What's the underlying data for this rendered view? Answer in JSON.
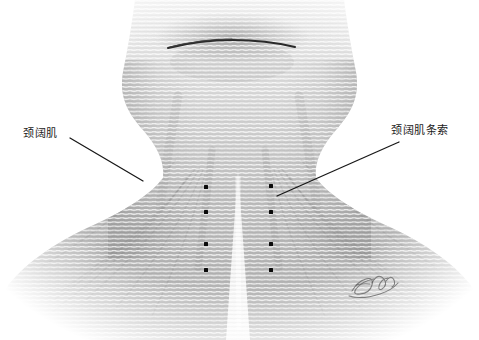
{
  "illustration": {
    "title": "Platysma anatomy illustration",
    "style": "graphite-pencil-grayscale",
    "background_color": "#ffffff",
    "width": 479,
    "height": 340,
    "subject": "anterior neck and upper chest"
  },
  "labels": [
    {
      "id": "platysma",
      "text": "颈阔肌",
      "side": "left",
      "text_x": 23,
      "text_y": 127,
      "leader_from": [
        70,
        138
      ],
      "leader_to": [
        143,
        181
      ]
    },
    {
      "id": "platysma-bands",
      "text": "颈阔肌条索",
      "side": "right",
      "text_x": 391,
      "text_y": 124,
      "leader_from": [
        399,
        142
      ],
      "leader_to": [
        277,
        196
      ]
    }
  ],
  "markers": {
    "name": "injection-point-dots",
    "color": "#0a0a0a",
    "columns": [
      {
        "column": "left",
        "x": 206,
        "ys": [
          187,
          212,
          244,
          270
        ]
      },
      {
        "column": "right",
        "x": 271,
        "ys": [
          186,
          212,
          244,
          270
        ]
      }
    ]
  },
  "anatomy_features": [
    {
      "name": "mandible-border-line",
      "x_start": 168,
      "x_end": 295,
      "y": 47
    },
    {
      "name": "chin-shadow",
      "cx": 232,
      "cy": 40
    },
    {
      "name": "neck-left-contour",
      "description": "concave curve from jaw to shoulder"
    },
    {
      "name": "neck-right-contour",
      "description": "concave curve from jaw to shoulder"
    },
    {
      "name": "suprasternal-midline-gap",
      "cx": 238,
      "y_top": 175,
      "y_bottom": 320
    },
    {
      "name": "platysma-striations",
      "description": "horizontal fiber texture across neck and chest"
    },
    {
      "name": "shoulder-fan-fibers",
      "description": "radiating fibers spreading down and outward"
    }
  ],
  "signature": {
    "name": "artist-signature-watermark",
    "x": 370,
    "y": 285,
    "visible": true
  },
  "colors": {
    "background": "#ffffff",
    "skin_light": "#f2f2f2",
    "skin_mid": "#c9c9c9",
    "skin_dark": "#9d9d9d",
    "line_dark": "#1a1a1a",
    "label_text": "#1a1a1a"
  }
}
